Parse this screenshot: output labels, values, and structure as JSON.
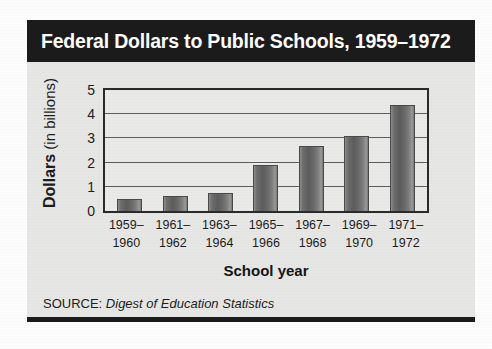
{
  "figure": {
    "title": "Federal Dollars to Public Schools, 1959–1972",
    "source_label": "SOURCE:",
    "source_title": "Digest of Education Statistics",
    "y_axis_title_strong": "Dollars",
    "y_axis_title_light": " (in billions)",
    "x_axis_title": "School year",
    "colors": {
      "title_band": "#1b1b1b",
      "title_text": "#ffffff",
      "panel_background": "#e6e6e4",
      "plot_background": "#e9e9e7",
      "bar_fill": "#6e6e6e",
      "axis_line": "#2a2a2a",
      "gridline": "#5d5d5d"
    }
  },
  "chart_data": {
    "type": "bar",
    "title": "Federal Dollars to Public Schools, 1959–1972",
    "xlabel": "School year",
    "ylabel": "Dollars (in billions)",
    "ylim": [
      0,
      5
    ],
    "yticks": [
      0,
      1,
      2,
      3,
      4,
      5
    ],
    "ytick_labels": [
      "0",
      "1",
      "2",
      "3",
      "4",
      "5"
    ],
    "grid": true,
    "legend": false,
    "categories": [
      "1959–\n1960",
      "1961–\n1962",
      "1963–\n1964",
      "1965–\n1966",
      "1967–\n1968",
      "1969–\n1970",
      "1971–\n1972"
    ],
    "category_lines": [
      [
        "1959–",
        "1960"
      ],
      [
        "1961–",
        "1962"
      ],
      [
        "1963–",
        "1964"
      ],
      [
        "1965–",
        "1966"
      ],
      [
        "1967–",
        "1968"
      ],
      [
        "1969–",
        "1970"
      ],
      [
        "1971–",
        "1972"
      ]
    ],
    "values": [
      0.5,
      0.6,
      0.75,
      1.9,
      2.7,
      3.1,
      4.4
    ],
    "units": "billions of dollars",
    "annotations": [
      "SOURCE: Digest of Education Statistics"
    ]
  }
}
